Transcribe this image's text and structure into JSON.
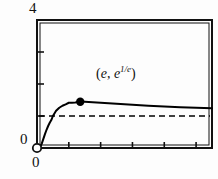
{
  "chart_data": {
    "type": "line",
    "title": "",
    "xlabel": "",
    "ylabel": "",
    "xlim": [
      0,
      11
    ],
    "ylim": [
      0,
      4
    ],
    "grid": false,
    "legend_position": "none",
    "x_tick_labels": [
      "0"
    ],
    "y_tick_labels": [
      "0",
      "4"
    ],
    "y_axis_top_label": "4",
    "y_axis_zero_label": "0",
    "x_axis_zero_label": "0",
    "y_tick_values": [
      1,
      2,
      3
    ],
    "x_tick_values": [
      2,
      4,
      6,
      8,
      10
    ],
    "series": [
      {
        "name": "x^(1/x)",
        "style": "solid",
        "color": "#000000",
        "x": [
          0.0,
          0.1,
          0.2,
          0.3,
          0.4,
          0.5,
          0.6,
          0.7,
          0.8,
          0.9,
          1.0,
          1.2,
          1.4,
          1.6,
          1.8,
          2.0,
          2.2,
          2.4,
          2.718,
          3.0,
          3.5,
          4.0,
          5.0,
          6.0,
          7.0,
          8.0,
          9.0,
          10.0,
          11.0
        ],
        "y": [
          0.0,
          0.0,
          0.0313,
          0.1389,
          0.2872,
          0.4353,
          0.5697,
          0.6877,
          0.788,
          0.872,
          1.0,
          1.162,
          1.2575,
          1.3205,
          1.3642,
          1.4142,
          1.4161,
          1.4199,
          1.4447,
          1.4422,
          1.4311,
          1.4142,
          1.3797,
          1.348,
          1.3205,
          1.2968,
          1.2765,
          1.2589,
          1.2434
        ]
      },
      {
        "name": "asymptote y = 1",
        "style": "dashed",
        "color": "#000000",
        "y_value": 1.0
      }
    ],
    "annotations": [
      {
        "name": "maximum-point",
        "text_paren_open": "(",
        "text_base_x": "e",
        "text_comma": ", ",
        "text_base_y": "e",
        "text_exponent_y": "1/e",
        "text_paren_close": ")",
        "full_text": "(e, e^(1/e))",
        "x": 2.718,
        "y": 1.4447
      }
    ],
    "markers": [
      {
        "name": "maximum-dot",
        "fill": "filled",
        "x": 2.718,
        "y": 1.4447
      },
      {
        "name": "origin-open-circle",
        "fill": "hollow",
        "x": 0,
        "y": 0
      }
    ]
  },
  "colors": {
    "line": "#000000",
    "frame": "#111111",
    "background": "#ffffff",
    "text": "#111111"
  }
}
